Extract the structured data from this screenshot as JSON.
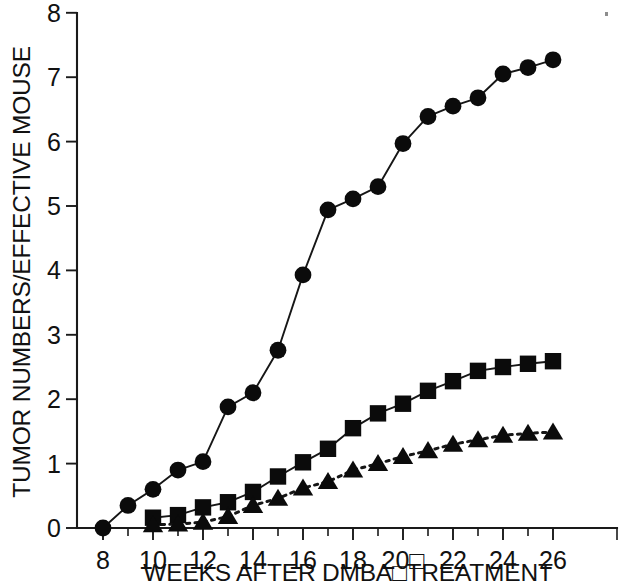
{
  "figure": {
    "background_color": "#ffffff",
    "ink_color": "#111111",
    "width": 625,
    "height": 585
  },
  "axes": {
    "y_title": "TUMOR NUMBERS/EFFECTIVE MOUSE",
    "x_title": "WEEKS AFTER DMBA□TREATMENT",
    "y_ticks": [
      "0",
      "1",
      "2",
      "3",
      "4",
      "5",
      "6",
      "7",
      "8"
    ],
    "x_ticks": [
      "8",
      "10",
      "12",
      "14",
      "16",
      "18",
      "20□",
      "22",
      "24",
      "26"
    ]
  },
  "chart_data": {
    "type": "line",
    "title": "",
    "subtitle": "",
    "xlabel": "WEEKS AFTER DMBA□TREATMENT",
    "ylabel": "TUMOR NUMBERS/EFFECTIVE MOUSE",
    "xlim": [
      7.2,
      26.8
    ],
    "ylim": [
      0,
      8
    ],
    "xticks": [
      8,
      10,
      12,
      14,
      16,
      18,
      20,
      22,
      24,
      26
    ],
    "xticks_minor": [
      9,
      11,
      13,
      15,
      17,
      19,
      21,
      23,
      25
    ],
    "yticks": [
      0,
      1,
      2,
      3,
      4,
      5,
      6,
      7,
      8
    ],
    "grid": false,
    "legend": "none",
    "legend_position": "none",
    "series": [
      {
        "name": "circles",
        "marker": "circle",
        "linestyle": "solid",
        "color": "#0b0b0b",
        "x": [
          8,
          9,
          10,
          11,
          12,
          13,
          14,
          15,
          16,
          17,
          18,
          19,
          20,
          21,
          22,
          23,
          24,
          25,
          26
        ],
        "values": [
          0.0,
          0.35,
          0.6,
          0.9,
          1.03,
          1.88,
          2.1,
          2.76,
          3.93,
          4.94,
          5.11,
          5.3,
          5.97,
          6.39,
          6.55,
          6.68,
          7.05,
          7.15,
          7.27
        ]
      },
      {
        "name": "squares",
        "marker": "square",
        "linestyle": "solid",
        "color": "#0b0b0b",
        "x": [
          10,
          11,
          12,
          13,
          14,
          15,
          16,
          17,
          18,
          19,
          20,
          21,
          22,
          23,
          24,
          25,
          26
        ],
        "values": [
          0.16,
          0.2,
          0.32,
          0.4,
          0.56,
          0.8,
          1.02,
          1.23,
          1.55,
          1.78,
          1.93,
          2.13,
          2.28,
          2.44,
          2.5,
          2.55,
          2.59
        ]
      },
      {
        "name": "triangles",
        "marker": "triangle",
        "linestyle": "dotted",
        "color": "#0b0b0b",
        "x": [
          10,
          11,
          12,
          13,
          14,
          15,
          16,
          17,
          18,
          19,
          20,
          21,
          22,
          23,
          24,
          25,
          26
        ],
        "values": [
          0.05,
          0.06,
          0.09,
          0.18,
          0.35,
          0.46,
          0.62,
          0.72,
          0.9,
          1.0,
          1.11,
          1.2,
          1.3,
          1.37,
          1.44,
          1.47,
          1.49
        ]
      }
    ]
  }
}
